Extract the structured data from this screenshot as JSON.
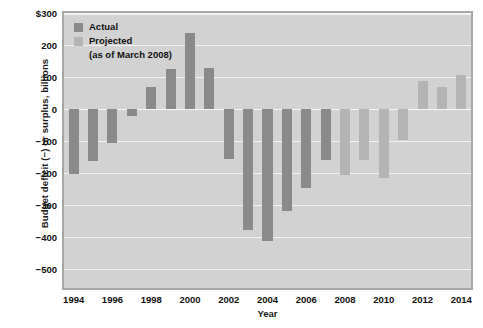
{
  "chart_data": {
    "type": "bar",
    "title": "",
    "xlabel": "Year",
    "ylabel": "Budget deficit (−) or surplus, billions",
    "ylim": [
      -560,
      300
    ],
    "yticks": [
      300,
      200,
      100,
      0,
      -100,
      -200,
      -300,
      -400,
      -500
    ],
    "ytick_labels": [
      "$300",
      "200",
      "100",
      "0",
      "−100",
      "−200",
      "−300",
      "−400",
      "−500"
    ],
    "xticks": [
      1994,
      1996,
      1998,
      2000,
      2002,
      2004,
      2006,
      2008,
      2010,
      2012,
      2014
    ],
    "xtick_labels": [
      "1994",
      "1996",
      "1998",
      "2000",
      "2002",
      "2004",
      "2006",
      "2008",
      "2010",
      "2012",
      "2014"
    ],
    "grid": true,
    "legend_position": "upper-left",
    "categories": [
      1994,
      1995,
      1996,
      1997,
      1998,
      1999,
      2000,
      2001,
      2002,
      2003,
      2004,
      2005,
      2006,
      2007,
      2008,
      2009,
      2010,
      2011,
      2012,
      2013,
      2014
    ],
    "series": [
      {
        "name": "Actual",
        "color": "#8a8a8a",
        "values": [
          -203,
          -164,
          -107,
          -22,
          69,
          126,
          236,
          128,
          -158,
          -378,
          -413,
          -318,
          -248,
          -161,
          null,
          null,
          null,
          null,
          null,
          null,
          null
        ]
      },
      {
        "name": "Projected (as of March 2008)",
        "color": "#b4b4b4",
        "values": [
          null,
          null,
          null,
          null,
          null,
          null,
          null,
          null,
          null,
          null,
          null,
          null,
          null,
          null,
          -207,
          -160,
          -216,
          -98,
          87,
          70,
          105
        ]
      }
    ]
  },
  "legend": {
    "actual_label": "Actual",
    "projected_label": "Projected",
    "projected_sublabel": "(as of March 2008)"
  },
  "colors": {
    "actual": "#8a8a8a",
    "projected": "#b4b4b4",
    "plot_background": "#d2d2d2",
    "gridline": "#f2f2f2",
    "plot_border": "#a8a8a8",
    "text": "#111111"
  }
}
